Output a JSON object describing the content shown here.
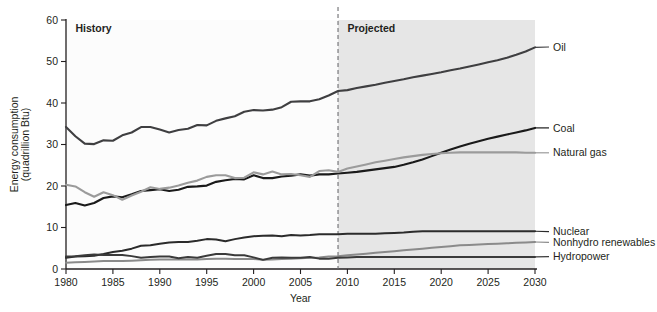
{
  "chart_data": {
    "type": "line",
    "title": "",
    "xlabel": "Year",
    "ylabel": "Energy consumption\n(quadrillion Btu)",
    "ylabel_line1": "Energy consumption",
    "ylabel_line2": "(quadrillion Btu)",
    "xlim": [
      1980,
      2030
    ],
    "ylim": [
      0,
      60
    ],
    "xticks": [
      1980,
      1985,
      1990,
      1995,
      2000,
      2005,
      2010,
      2015,
      2020,
      2025,
      2030
    ],
    "yticks": [
      0,
      10,
      20,
      30,
      40,
      50,
      60
    ],
    "grid": false,
    "legend_position": "right-inline-labels",
    "annotations": [
      {
        "name": "history",
        "label": "History",
        "x": 1981,
        "y": 58
      },
      {
        "name": "projected",
        "label": "Projected",
        "x": 2010,
        "y": 58
      }
    ],
    "split_year": 2009,
    "colors": {
      "oil": "#3f3f41",
      "coal": "#1a1a1a",
      "natural_gas": "#9b9b9b",
      "nuclear": "#2b2b2b",
      "nonhydro_renewables": "#8a8a8a",
      "hydropower": "#3a3a3a",
      "projected_band": "#e6e6e6",
      "history_band": "#fcfcfc",
      "divider": "#6d6e71",
      "axis": "#231f20"
    },
    "x": [
      1980,
      1981,
      1982,
      1983,
      1984,
      1985,
      1986,
      1987,
      1988,
      1989,
      1990,
      1991,
      1992,
      1993,
      1994,
      1995,
      1996,
      1997,
      1998,
      1999,
      2000,
      2001,
      2002,
      2003,
      2004,
      2005,
      2006,
      2007,
      2008,
      2009,
      2010,
      2011,
      2012,
      2013,
      2014,
      2015,
      2016,
      2017,
      2018,
      2019,
      2020,
      2021,
      2022,
      2023,
      2024,
      2025,
      2026,
      2027,
      2028,
      2029,
      2030
    ],
    "series": [
      {
        "name": "Oil",
        "label": "Oil",
        "color": "#3f3f41",
        "width": 2.1,
        "label_y": 53.5,
        "values": [
          34.2,
          32.0,
          30.2,
          30.1,
          31.0,
          30.9,
          32.2,
          32.9,
          34.2,
          34.2,
          33.6,
          32.9,
          33.5,
          33.8,
          34.7,
          34.6,
          35.7,
          36.3,
          36.8,
          37.9,
          38.3,
          38.2,
          38.4,
          39.0,
          40.3,
          40.4,
          40.4,
          40.9,
          41.8,
          42.9,
          43.1,
          43.6,
          44.0,
          44.4,
          44.9,
          45.3,
          45.7,
          46.2,
          46.6,
          47.0,
          47.4,
          47.9,
          48.3,
          48.8,
          49.3,
          49.8,
          50.3,
          50.9,
          51.6,
          52.4,
          53.4
        ]
      },
      {
        "name": "Coal",
        "label": "Coal",
        "color": "#1a1a1a",
        "width": 2.1,
        "label_y": 34.0,
        "values": [
          15.4,
          15.9,
          15.3,
          15.9,
          17.1,
          17.5,
          17.3,
          18.0,
          18.8,
          19.0,
          19.2,
          18.8,
          19.1,
          19.8,
          19.9,
          20.1,
          21.0,
          21.4,
          21.7,
          21.6,
          22.6,
          21.9,
          21.9,
          22.3,
          22.5,
          22.8,
          22.5,
          22.8,
          22.8,
          23.0,
          23.2,
          23.4,
          23.7,
          24.0,
          24.3,
          24.6,
          25.1,
          25.7,
          26.4,
          27.2,
          28.0,
          28.8,
          29.5,
          30.2,
          30.8,
          31.4,
          31.9,
          32.4,
          32.9,
          33.4,
          34.0
        ]
      },
      {
        "name": "Natural gas",
        "label": "Natural gas",
        "color": "#9b9b9b",
        "width": 2.1,
        "label_y": 28.0,
        "values": [
          20.3,
          19.9,
          18.5,
          17.4,
          18.5,
          17.8,
          16.7,
          17.7,
          18.6,
          19.7,
          19.3,
          19.6,
          20.1,
          20.8,
          21.3,
          22.2,
          22.6,
          22.6,
          21.9,
          22.0,
          23.3,
          22.8,
          23.5,
          22.8,
          22.9,
          22.6,
          22.2,
          23.6,
          23.8,
          23.4,
          24.2,
          24.7,
          25.2,
          25.7,
          26.1,
          26.5,
          26.9,
          27.2,
          27.5,
          27.7,
          27.9,
          28.0,
          28.1,
          28.1,
          28.1,
          28.1,
          28.1,
          28.1,
          28.1,
          28.0,
          28.0
        ]
      },
      {
        "name": "Nuclear",
        "label": "Nuclear",
        "color": "#2b2b2b",
        "width": 2.0,
        "label_y": 9.0,
        "values": [
          2.7,
          3.0,
          3.1,
          3.2,
          3.6,
          4.1,
          4.4,
          4.9,
          5.6,
          5.7,
          6.1,
          6.4,
          6.5,
          6.5,
          6.8,
          7.2,
          7.1,
          6.7,
          7.2,
          7.6,
          7.9,
          8.0,
          8.1,
          7.9,
          8.2,
          8.1,
          8.2,
          8.4,
          8.4,
          8.4,
          8.5,
          8.5,
          8.5,
          8.5,
          8.6,
          8.7,
          8.8,
          9.0,
          9.1,
          9.1,
          9.1,
          9.1,
          9.1,
          9.1,
          9.1,
          9.1,
          9.1,
          9.1,
          9.1,
          9.1,
          9.1
        ]
      },
      {
        "name": "Nonhydro renewables",
        "label": "Nonhydro renewables",
        "color": "#8a8a8a",
        "width": 2.0,
        "label_y": 6.4,
        "values": [
          1.5,
          1.6,
          1.7,
          1.8,
          1.9,
          1.9,
          1.9,
          2.0,
          2.1,
          2.2,
          2.3,
          2.3,
          2.3,
          2.3,
          2.3,
          2.4,
          2.5,
          2.5,
          2.4,
          2.4,
          2.4,
          2.2,
          2.3,
          2.4,
          2.5,
          2.6,
          2.7,
          2.8,
          3.0,
          3.1,
          3.3,
          3.5,
          3.7,
          3.9,
          4.1,
          4.3,
          4.5,
          4.7,
          4.9,
          5.1,
          5.3,
          5.5,
          5.7,
          5.8,
          5.9,
          6.0,
          6.1,
          6.2,
          6.3,
          6.4,
          6.5
        ]
      },
      {
        "name": "Hydropower",
        "label": "Hydropower",
        "color": "#3a3a3a",
        "width": 2.0,
        "label_y": 3.0,
        "values": [
          3.0,
          3.1,
          3.3,
          3.5,
          3.4,
          3.4,
          3.4,
          3.1,
          2.7,
          2.9,
          3.0,
          3.0,
          2.6,
          2.9,
          2.7,
          3.2,
          3.6,
          3.6,
          3.3,
          3.3,
          2.8,
          2.2,
          2.7,
          2.8,
          2.7,
          2.7,
          2.9,
          2.5,
          2.5,
          2.7,
          2.8,
          2.9,
          2.9,
          2.9,
          2.9,
          2.9,
          2.9,
          2.9,
          2.9,
          2.9,
          2.9,
          2.9,
          2.9,
          2.9,
          2.9,
          2.9,
          2.9,
          2.9,
          2.9,
          2.9,
          2.9
        ]
      }
    ]
  }
}
